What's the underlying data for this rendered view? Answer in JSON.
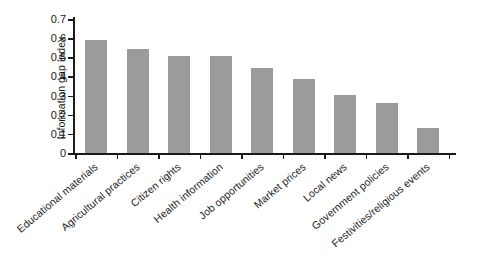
{
  "chart_data": {
    "type": "bar",
    "title": "",
    "xlabel": "",
    "ylabel": "Information gap index",
    "ylim": [
      0,
      0.7
    ],
    "yticks": [
      "0",
      "0.1",
      "0.2",
      "0.3",
      "0.4",
      "0.5",
      "0.6",
      "0.7"
    ],
    "ytick_values": [
      0,
      0.1,
      0.2,
      0.3,
      0.4,
      0.5,
      0.6,
      0.7
    ],
    "grid": false,
    "legend": "none",
    "bar_color": "#9b9b9b",
    "axis_color": "#1a1a1a",
    "background_color": "#ffffff",
    "categories": [
      "Educational materials",
      "Agricultural practices",
      "Citizen rights",
      "Health information",
      "Job opportunities",
      "Market prices",
      "Local news",
      "Government policies",
      "Festivities/religious events"
    ],
    "values": [
      0.59,
      0.545,
      0.505,
      0.505,
      0.445,
      0.385,
      0.305,
      0.26,
      0.13
    ]
  }
}
